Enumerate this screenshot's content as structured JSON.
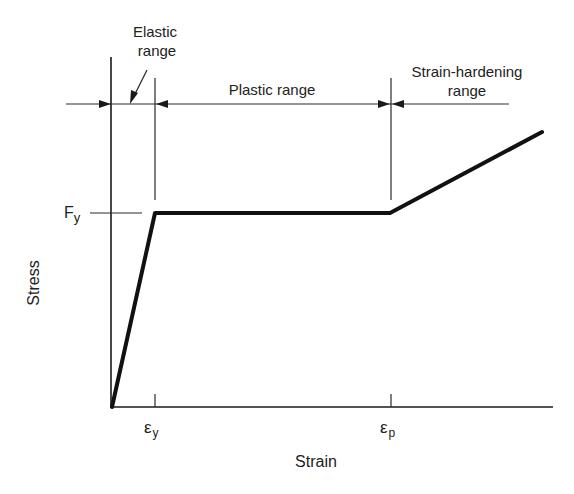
{
  "diagram": {
    "type": "stress-strain-curve",
    "ranges": [
      {
        "id": "elastic",
        "label_line1": "Elastic",
        "label_line2": "range"
      },
      {
        "id": "plastic",
        "label": "Plastic range"
      },
      {
        "id": "strain_hardening",
        "label_line1": "Strain-hardening",
        "label_line2": "range"
      }
    ],
    "axes": {
      "x_label": "Strain",
      "y_label": "Stress"
    },
    "markers": {
      "yield_stress": {
        "symbol": "F",
        "subscript": "y"
      },
      "yield_strain": {
        "symbol": "ε",
        "subscript": "y"
      },
      "hardening_strain": {
        "symbol": "ε",
        "subscript": "p"
      }
    },
    "curve_points": [
      {
        "x": 112,
        "y": 407
      },
      {
        "x": 155,
        "y": 213
      },
      {
        "x": 390,
        "y": 213
      },
      {
        "x": 542,
        "y": 132
      }
    ],
    "colors": {
      "ink": "#1a1a1a",
      "background": "#ffffff"
    }
  }
}
